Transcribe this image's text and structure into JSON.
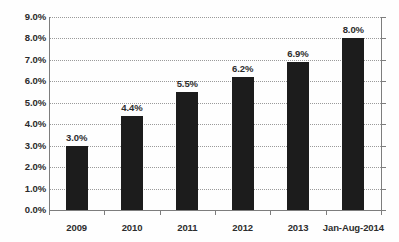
{
  "chart_data": {
    "type": "bar",
    "title": "",
    "subtitle": "",
    "xlabel": "",
    "ylabel": "",
    "categories": [
      "2009",
      "2010",
      "2011",
      "2012",
      "2013",
      "Jan-Aug-2014"
    ],
    "values": [
      3.0,
      4.4,
      5.5,
      6.2,
      6.9,
      8.0
    ],
    "value_labels": [
      "3.0%",
      "4.4%",
      "5.5%",
      "6.2%",
      "6.9%",
      "8.0%"
    ],
    "ylim": [
      0.0,
      9.0
    ],
    "ytick_values": [
      0.0,
      1.0,
      2.0,
      3.0,
      4.0,
      5.0,
      6.0,
      7.0,
      8.0,
      9.0
    ],
    "ytick_labels": [
      "0.0%",
      "1.0%",
      "2.0%",
      "3.0%",
      "4.0%",
      "5.0%",
      "6.0%",
      "7.0%",
      "8.0%",
      "9.0%"
    ],
    "grid": true,
    "grid_style": "dotted-horizontal",
    "legend": false,
    "legend_position": "none",
    "bar_color": "#1c1c1c",
    "grid_color": "#9a9a9a",
    "axis_color": "#7d7d7d",
    "text_color": "#2d2d2d",
    "background_color": "#fefefe"
  }
}
